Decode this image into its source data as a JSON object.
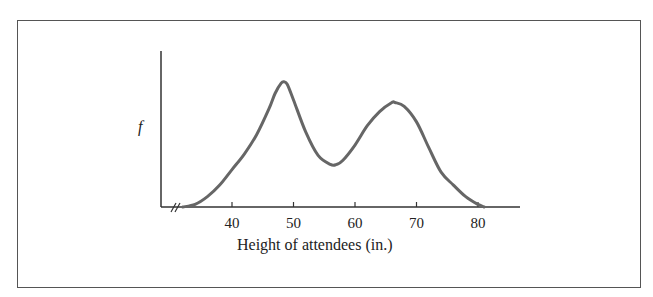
{
  "chart_data": {
    "type": "line",
    "title": "",
    "xlabel": "Height of attendees (in.)",
    "ylabel": "f",
    "x_ticks": [
      40,
      50,
      60,
      70,
      80
    ],
    "xlim": [
      30,
      87
    ],
    "axis_break": true,
    "grid": false,
    "legend": null,
    "series": [
      {
        "name": "frequency",
        "color": "#666666",
        "x": [
          32,
          34,
          36,
          38,
          40,
          42,
          44,
          46,
          47,
          48,
          48.5,
          49,
          50,
          52,
          54,
          56,
          57,
          58,
          60,
          62,
          64,
          66,
          66.5,
          68,
          70,
          72,
          74,
          76,
          78,
          80,
          81
        ],
        "y": [
          0,
          0.02,
          0.08,
          0.17,
          0.29,
          0.41,
          0.56,
          0.76,
          0.88,
          0.96,
          0.97,
          0.95,
          0.83,
          0.58,
          0.4,
          0.33,
          0.33,
          0.36,
          0.48,
          0.63,
          0.74,
          0.81,
          0.81,
          0.78,
          0.66,
          0.46,
          0.27,
          0.17,
          0.08,
          0.02,
          0
        ]
      }
    ]
  },
  "labels": {
    "x_axis_title": "Height of attendees (in.)",
    "y_axis_title": "f",
    "ticks": [
      "40",
      "50",
      "60",
      "70",
      "80"
    ]
  }
}
